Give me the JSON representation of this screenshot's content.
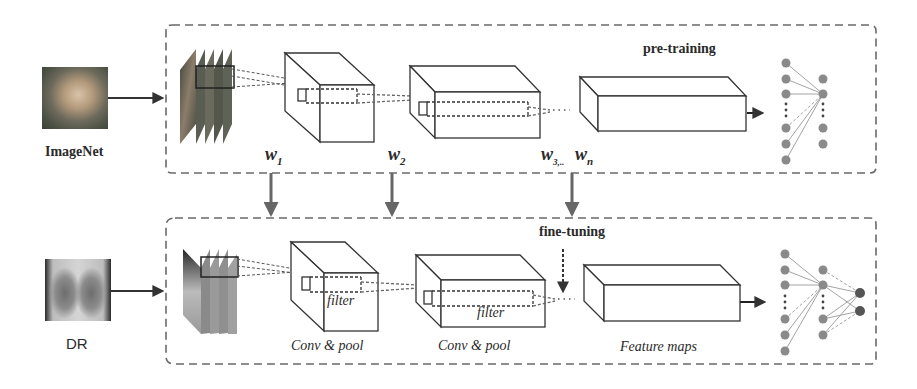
{
  "diagram": {
    "colors": {
      "line": "#3a3a3a",
      "dash": "#707070",
      "arrow": "#555555",
      "node": "#8a8a8a",
      "node_dark": "#5a5a5a",
      "background": "#ffffff"
    },
    "top_panel": {
      "stage_label": "pre-training",
      "input_label": "ImageNet",
      "input_icon": "cat-photo-icon",
      "weights": [
        "w1",
        "w2",
        "w3...wn"
      ],
      "weight_labels": {
        "w1": {
          "base": "w",
          "sub": "1"
        },
        "w2": {
          "base": "w",
          "sub": "2"
        },
        "w3": {
          "base": "w",
          "sub": "3,.."
        },
        "wn": {
          "base": "w",
          "sub": "n"
        }
      }
    },
    "bottom_panel": {
      "stage_label": "fine-tuning",
      "input_label": "DR",
      "input_icon": "chest-xray-icon",
      "layer_labels": [
        "Conv & pool",
        "Conv & pool",
        "Feature maps"
      ],
      "filter_labels": [
        "filter",
        "filter"
      ]
    },
    "edges": [
      {
        "from": "ImageNet",
        "to": "top_panel"
      },
      {
        "from": "DR",
        "to": "bottom_panel"
      },
      {
        "from": "w1",
        "to": "bottom_conv1"
      },
      {
        "from": "w2",
        "to": "bottom_conv2"
      },
      {
        "from": "w3...wn",
        "to": "bottom_feature_maps"
      },
      {
        "from": "top_feature_maps",
        "to": "top_fc"
      },
      {
        "from": "bottom_feature_maps",
        "to": "bottom_fc"
      }
    ]
  }
}
